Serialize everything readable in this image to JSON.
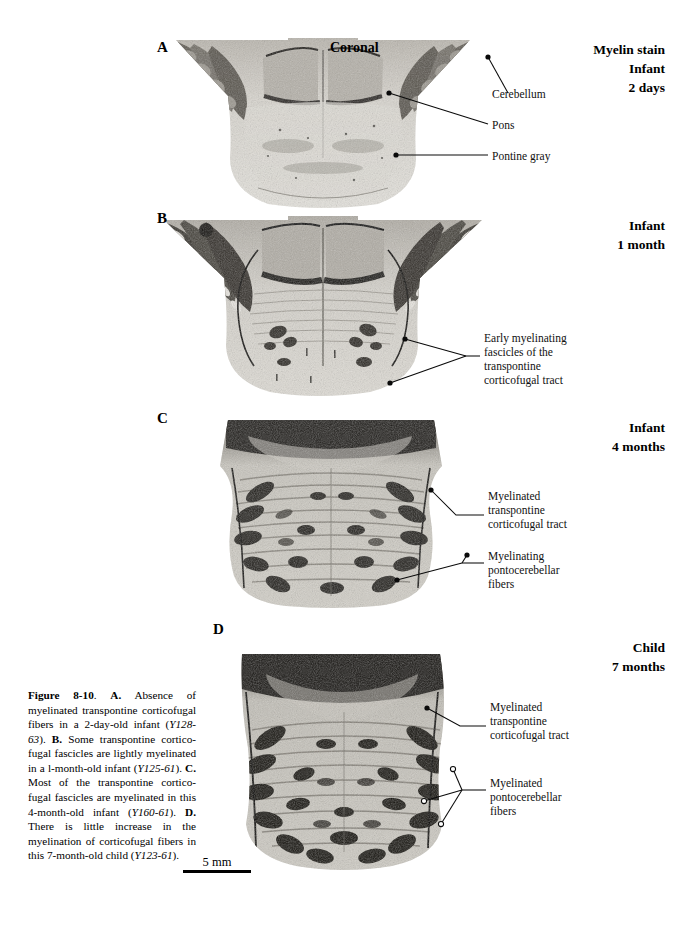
{
  "figure": {
    "orientation_title": "Coronal",
    "scale_bar": {
      "label": "5 mm"
    }
  },
  "panels": [
    {
      "letter": "A",
      "heading_lines": [
        "Myelin stain",
        "Infant",
        "2 days"
      ],
      "callouts": [
        {
          "name": "cerebellum",
          "text": "Cerebellum"
        },
        {
          "name": "pons",
          "text": "Pons"
        },
        {
          "name": "pontine-gray",
          "text": "Pontine gray"
        }
      ]
    },
    {
      "letter": "B",
      "heading_lines": [
        "Infant",
        "1 month"
      ],
      "callouts": [
        {
          "name": "early-myelinating-fascicles",
          "text": "Early myelinating\nfascicles of the\ntranspontine\ncorticofugal tract"
        }
      ]
    },
    {
      "letter": "C",
      "heading_lines": [
        "Infant",
        "4 months"
      ],
      "callouts": [
        {
          "name": "myelinated-transpontine-corticofugal-tract",
          "text": "Myelinated\ntranspontine\ncorticofugal tract"
        },
        {
          "name": "myelinating-pontocerebellar-fibers",
          "text": "Myelinating\npontocerebellar\nfibers"
        }
      ]
    },
    {
      "letter": "D",
      "heading_lines": [
        "Child",
        "7 months"
      ],
      "callouts": [
        {
          "name": "myelinated-transpontine-corticofugal-tract",
          "text": "Myelinated\ntranspontine\ncorticofugal tract"
        },
        {
          "name": "myelinated-pontocerebellar-fibers",
          "text": "Myelinated\npontocerebellar\nfibers"
        }
      ]
    }
  ],
  "caption": {
    "figure_number": "Figure 8-10",
    "segments": [
      {
        "style": "bold",
        "text": "Figure 8-10"
      },
      {
        "style": "plain",
        "text": ". "
      },
      {
        "style": "bold",
        "text": "A."
      },
      {
        "style": "plain",
        "text": " Absence of myelinated transpontine corticofugal fibers in a 2-day-old infant ("
      },
      {
        "style": "italic",
        "text": "Y128-63"
      },
      {
        "style": "plain",
        "text": "). "
      },
      {
        "style": "bold",
        "text": "B."
      },
      {
        "style": "plain",
        "text": " Some transpontine cortico-fugal fascicles are lightly myelinated in a l-month-old infant ("
      },
      {
        "style": "italic",
        "text": "Y125-61"
      },
      {
        "style": "plain",
        "text": "). "
      },
      {
        "style": "bold",
        "text": "C."
      },
      {
        "style": "plain",
        "text": " Most of the transpontine cortico-fugal fascicles are myelinated in this 4-month-old infant ("
      },
      {
        "style": "italic",
        "text": "Y160-61"
      },
      {
        "style": "plain",
        "text": "). "
      },
      {
        "style": "bold",
        "text": "D."
      },
      {
        "style": "plain",
        "text": " There is little increase in the myelination of corticofugal fibers in this 7-month-old child ("
      },
      {
        "style": "italic",
        "text": "Y123-61"
      },
      {
        "style": "plain",
        "text": ")."
      }
    ]
  },
  "colors": {
    "ink": "#000000",
    "page": "#ffffff",
    "tissue_light": "#d9d6cf",
    "tissue_mid": "#9c9890",
    "tissue_dark": "#3a3834",
    "leader_line": "#0a0a0a"
  }
}
